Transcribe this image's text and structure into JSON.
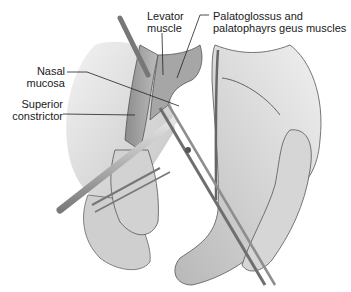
{
  "figure": {
    "labels": {
      "levator": {
        "line1": "Levator",
        "line2": "muscle"
      },
      "palatoglossus": {
        "line1": "Palatoglossus and",
        "line2": "palatophayrs geus muscles"
      },
      "nasal_mucosa": {
        "line1": "Nasal",
        "line2": "mucosa"
      },
      "superior_constrictor": {
        "line1": "Superior",
        "line2": "constrictor"
      }
    },
    "colors": {
      "tissue_light": "#e4e4e4",
      "tissue_mid": "#c4c4c4",
      "tissue_dark": "#8a8a8a",
      "outline": "#555555",
      "instrument": "#9a9a9a",
      "text": "#1a1a1a"
    }
  }
}
